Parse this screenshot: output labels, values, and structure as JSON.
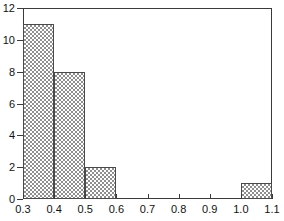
{
  "chart_data": {
    "type": "bar",
    "title": "",
    "subtitle": "",
    "xlabel": "",
    "ylabel": "",
    "bin_width": 0.1,
    "bin_edges": [
      0.3,
      0.4,
      0.5,
      0.6,
      0.7,
      0.8,
      0.9,
      1.0,
      1.1
    ],
    "categories": [
      "0.3-0.4",
      "0.4-0.5",
      "0.5-0.6",
      "0.6-0.7",
      "0.7-0.8",
      "0.8-0.9",
      "0.9-1.0",
      "1.0-1.1"
    ],
    "values": [
      11,
      8,
      2,
      0,
      0,
      0,
      0,
      1
    ],
    "bars": [
      {
        "label": "0.3-0.4",
        "x0": 0.3,
        "x1": 0.4,
        "value": 11
      },
      {
        "label": "0.4-0.5",
        "x0": 0.4,
        "x1": 0.5,
        "value": 8
      },
      {
        "label": "0.5-0.6",
        "x0": 0.5,
        "x1": 0.6,
        "value": 2
      },
      {
        "label": "0.6-0.7",
        "x0": 0.6,
        "x1": 0.7,
        "value": 0
      },
      {
        "label": "0.7-0.8",
        "x0": 0.7,
        "x1": 0.8,
        "value": 0
      },
      {
        "label": "0.8-0.9",
        "x0": 0.8,
        "x1": 0.9,
        "value": 0
      },
      {
        "label": "0.9-1.0",
        "x0": 0.9,
        "x1": 1.0,
        "value": 0
      },
      {
        "label": "1.0-1.1",
        "x0": 1.0,
        "x1": 1.1,
        "value": 1
      }
    ],
    "xlim": [
      0.3,
      1.1
    ],
    "ylim": [
      0,
      12
    ],
    "xticks": [
      0.3,
      0.4,
      0.5,
      0.6,
      0.7,
      0.8,
      0.9,
      1.0,
      1.1
    ],
    "xtick_labels": [
      "0.3",
      "0.4",
      "0.5",
      "0.6",
      "0.7",
      "0.8",
      "0.9",
      "1.0",
      "1.1"
    ],
    "yticks": [
      0,
      2,
      4,
      6,
      8,
      10,
      12
    ],
    "ytick_labels": [
      "0",
      "2",
      "4",
      "6",
      "8",
      "10",
      "12"
    ],
    "grid": false,
    "legend": null,
    "legend_position": "none",
    "annotations": [],
    "colors": {
      "bar_fill": "#8f8f8f",
      "bar_background": "#ffffff",
      "bar_edge": "#4a4a4a",
      "axis": "#3a3a3a",
      "text": "#111111",
      "plot_background": "#ffffff"
    },
    "bar_pattern": "checkerboard-crosshatch"
  }
}
